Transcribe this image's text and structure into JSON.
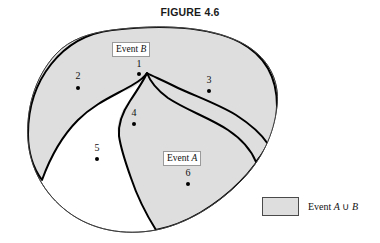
{
  "figure": {
    "title": "FIGURE 4.6",
    "caption_union_symbol": "∪"
  },
  "colors": {
    "fill_shaded": "#dedede",
    "outline_event": "#000000",
    "outline_sample_space": "#333333",
    "background": "#ffffff",
    "text": "#111111"
  },
  "labels": {
    "event_b": {
      "prefix": "Event ",
      "name": "B"
    },
    "event_a": {
      "prefix": "Event ",
      "name": "A"
    }
  },
  "points": [
    {
      "id": "1",
      "label": "1",
      "x": 139,
      "y": 64,
      "dot_x": 139,
      "dot_y": 74,
      "region": "B only"
    },
    {
      "id": "2",
      "label": "2",
      "x": 78,
      "y": 76,
      "dot_x": 78,
      "dot_y": 88,
      "region": "B only"
    },
    {
      "id": "3",
      "label": "3",
      "x": 209,
      "y": 80,
      "dot_x": 209,
      "dot_y": 91,
      "region": "A and B"
    },
    {
      "id": "4",
      "label": "4",
      "x": 134,
      "y": 113,
      "dot_x": 134,
      "dot_y": 124,
      "region": "A only"
    },
    {
      "id": "5",
      "label": "5",
      "x": 97,
      "y": 148,
      "dot_x": 97,
      "dot_y": 159,
      "region": "neither"
    },
    {
      "id": "6",
      "label": "6",
      "x": 188,
      "y": 173,
      "dot_x": 188,
      "dot_y": 184,
      "region": "A only"
    }
  ],
  "legend": {
    "swatch_fill": "#dedede",
    "prefix": "Event ",
    "set_a": "A",
    "union": "∪",
    "set_b": "B"
  }
}
